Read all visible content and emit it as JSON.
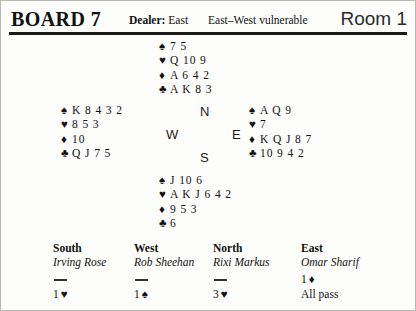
{
  "header": {
    "board_title": "BOARD 7",
    "dealer_label": "Dealer:",
    "dealer_value": "East",
    "vulnerability": "East–West vulnerable",
    "room": "Room 1"
  },
  "compass": {
    "north": "N",
    "west": "W",
    "east": "E",
    "south": "S"
  },
  "suit_symbols": {
    "spade": "♠",
    "heart": "♥",
    "diamond": "♦",
    "club": "♣"
  },
  "hands": {
    "north": {
      "seat": "North",
      "spades": "7 5",
      "hearts": "Q 10 9",
      "diamonds": "A 6 4 2",
      "clubs": "A K 8 3"
    },
    "west": {
      "seat": "West",
      "spades": "K 8 4 3 2",
      "hearts": "8 5 3",
      "diamonds": "10",
      "clubs": "Q J 7 5"
    },
    "east": {
      "seat": "East",
      "spades": "A Q 9",
      "hearts": "7",
      "diamonds": "K Q J 8 7",
      "clubs": "10 9 4 2"
    },
    "south": {
      "seat": "South",
      "spades": "J 10 6",
      "hearts": "A K J 6 4 2",
      "diamonds": "9 5 3",
      "clubs": "6"
    }
  },
  "auction": {
    "columns": [
      {
        "seat": "South",
        "player": "Irving Rose",
        "bids": [
          {
            "type": "dash",
            "level": "",
            "suit": ""
          },
          {
            "type": "bid",
            "level": "1",
            "suit": "♥"
          }
        ]
      },
      {
        "seat": "West",
        "player": "Rob Sheehan",
        "bids": [
          {
            "type": "dash",
            "level": "",
            "suit": ""
          },
          {
            "type": "bid",
            "level": "1",
            "suit": "♠"
          }
        ]
      },
      {
        "seat": "North",
        "player": "Rixi Markus",
        "bids": [
          {
            "type": "dash",
            "level": "",
            "suit": ""
          },
          {
            "type": "bid",
            "level": "3",
            "suit": "♥"
          }
        ]
      },
      {
        "seat": "East",
        "player": "Omar Sharif",
        "bids": [
          {
            "type": "bid",
            "level": "1",
            "suit": "♦"
          },
          {
            "type": "text",
            "level": "All pass",
            "suit": ""
          }
        ]
      }
    ]
  },
  "colors": {
    "ink": "#111111",
    "rule": "#1a1a1a",
    "paper": "#fdfdfb",
    "border": "#b9b9b4"
  }
}
